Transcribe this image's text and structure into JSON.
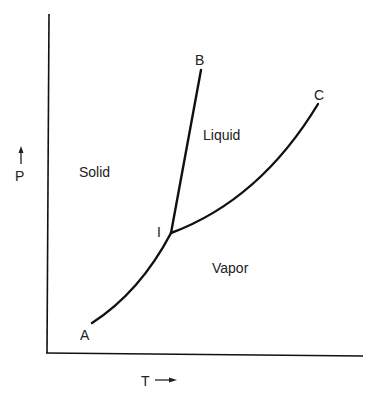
{
  "diagram": {
    "type": "phase-diagram",
    "axes": {
      "y_label": "P",
      "x_label": "T"
    },
    "regions": {
      "solid": "Solid",
      "liquid": "Liquid",
      "vapor": "Vapor"
    },
    "points": {
      "triple_point": "I",
      "sublimation_end": "A",
      "melting_end": "B",
      "critical_point": "C"
    },
    "curves": [
      {
        "name": "sublimation-curve",
        "from": "A",
        "to": "I"
      },
      {
        "name": "melting-curve",
        "from": "I",
        "to": "B"
      },
      {
        "name": "vaporization-curve",
        "from": "I",
        "to": "C"
      }
    ],
    "colors": {
      "line": "#111111",
      "text": "#222222",
      "background": "#ffffff"
    }
  }
}
